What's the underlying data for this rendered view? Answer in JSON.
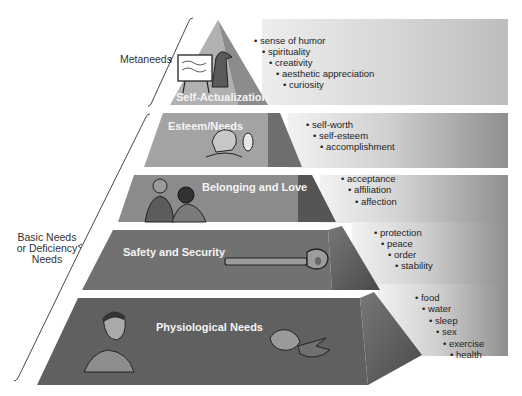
{
  "diagram": {
    "type": "pyramid",
    "title": "",
    "groups": [
      {
        "label": "Metaneeds",
        "covers": [
          "Self-Actualization"
        ]
      },
      {
        "label_lines": [
          "Basic Needs",
          "or Deficiency",
          "Needs"
        ],
        "covers": [
          "Esteem/Needs",
          "Belonging and Love",
          "Safety and Security",
          "Physiological Needs"
        ]
      }
    ],
    "tiers": [
      {
        "label": "Self-Actualization",
        "illustration": "painter-at-easel",
        "items": [
          "sense of humor",
          "spirituality",
          "creativity",
          "aesthetic appreciation",
          "curiosity"
        ]
      },
      {
        "label": "Esteem/Needs",
        "illustration": "person-with-mirror",
        "items": [
          "self-worth",
          "self-esteem",
          "accomplishment"
        ]
      },
      {
        "label": "Belonging and Love",
        "illustration": "two-people-talking",
        "items": [
          "acceptance",
          "affiliation",
          "affection"
        ]
      },
      {
        "label": "Safety and Security",
        "illustration": "key",
        "items": [
          "protection",
          "peace",
          "order",
          "stability"
        ]
      },
      {
        "label": "Physiological Needs",
        "illustration": "eating-and-sleeping",
        "items": [
          "food",
          "water",
          "sleep",
          "sex",
          "exercise",
          "health"
        ]
      }
    ],
    "bullet": "•",
    "colors": {
      "tier_top": "#b3b3b3",
      "tier_2": "#a2a2a2",
      "tier_3": "#8a8a8a",
      "tier_4": "#6f6f6f",
      "tier_5": "#5e5e5e",
      "band_light": "#f0f0f0",
      "band_dark": "#9a9a9a",
      "label_text": "#f4f4f4",
      "item_text": "#1e1e1e"
    }
  }
}
